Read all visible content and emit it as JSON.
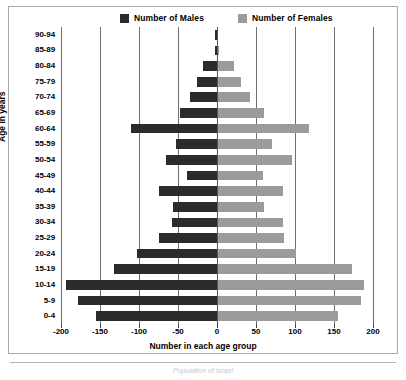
{
  "chart_data": {
    "type": "bar",
    "title": "",
    "subtitle": "",
    "orientation": "horizontal",
    "style": "population-pyramid",
    "xlabel": "Number in each age group",
    "ylabel": "Age in years",
    "categories": [
      "0-4",
      "5-9",
      "10-14",
      "15-19",
      "20-24",
      "25-29",
      "30-34",
      "35-39",
      "40-44",
      "45-49",
      "50-54",
      "55-59",
      "60-64",
      "65-69",
      "70-74",
      "75-79",
      "80-84",
      "85-89",
      "90-94"
    ],
    "xlim": [
      -200,
      200
    ],
    "xticks": [
      -200,
      -150,
      -100,
      -50,
      0,
      50,
      100,
      150,
      200
    ],
    "xticklabels": [
      "-200",
      "-150",
      "-100",
      "-50",
      "0",
      "50",
      "100",
      "150",
      "200"
    ],
    "grid": true,
    "grid_axis": "x",
    "legend_position": "top",
    "series": [
      {
        "name": "Number of Males",
        "color": "#2b2b2b",
        "sign": "negative",
        "values": [
          -155,
          -178,
          -193,
          -132,
          -103,
          -75,
          -58,
          -57,
          -74,
          -38,
          -65,
          -52,
          -110,
          -48,
          -35,
          -26,
          -18,
          -3,
          -2
        ]
      },
      {
        "name": "Number of Females",
        "color": "#9b9b9b",
        "sign": "positive",
        "values": [
          155,
          185,
          188,
          173,
          101,
          86,
          84,
          60,
          84,
          59,
          96,
          70,
          118,
          60,
          42,
          31,
          22,
          3,
          1
        ]
      }
    ]
  },
  "legend": {
    "entries": [
      {
        "label": "Number of Males",
        "color": "#2b2b2b"
      },
      {
        "label": "Number of Females",
        "color": "#9b9b9b"
      }
    ]
  },
  "axes": {
    "y_title": "Age in years",
    "x_title": "Number in each age group"
  },
  "caption": {
    "text": "Population of Israel"
  }
}
